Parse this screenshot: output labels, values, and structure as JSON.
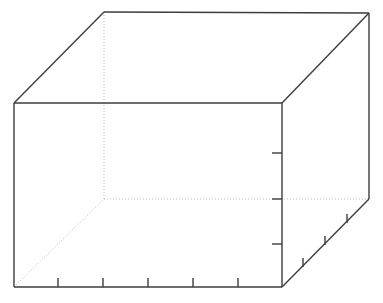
{
  "figure": {
    "title": "",
    "background_color": "#ffffff",
    "width": 383,
    "height": 303
  },
  "chart_data": {
    "type": "line",
    "title": "",
    "xlabel": "",
    "ylabel": "",
    "zlabel": "",
    "series": [],
    "categories": [],
    "values": [],
    "grid": false,
    "legend": "none",
    "projection": "3d",
    "note": "No data series plotted; only the empty 3D axes pane outline with tick marks is visible.",
    "axes_3d": {
      "solid_edge_color": "#3d3d3d",
      "hidden_edge_color": "#b6b6b6",
      "solid_edge_width": 1.4,
      "hidden_edge_width": 1.0,
      "hidden_edge_dash": "1,2",
      "tick_color": "#3d3d3d",
      "tick_width": 1.4,
      "vertices": {
        "front_bottom_left": {
          "x": 14,
          "y": 287
        },
        "front_top_left": {
          "x": 14,
          "y": 103
        },
        "front_bottom_right": {
          "x": 282,
          "y": 287
        },
        "front_top_right": {
          "x": 282,
          "y": 103
        },
        "back_top_left": {
          "x": 104,
          "y": 12
        },
        "back_top_right": {
          "x": 369,
          "y": 13
        },
        "back_bottom_right": {
          "x": 369,
          "y": 199
        },
        "back_bottom_left": {
          "x": 104,
          "y": 199
        }
      },
      "solid_edges": [
        {
          "name": "front-bottom-edge",
          "x1": 14,
          "y1": 287,
          "x2": 282,
          "y2": 287
        },
        {
          "name": "front-left-vertical-edge",
          "x1": 14,
          "y1": 287,
          "x2": 14,
          "y2": 103
        },
        {
          "name": "front-top-edge",
          "x1": 14,
          "y1": 103,
          "x2": 282,
          "y2": 103
        },
        {
          "name": "front-right-vertical-edge",
          "x1": 282,
          "y1": 103,
          "x2": 282,
          "y2": 287
        },
        {
          "name": "top-left-depth-edge",
          "x1": 14,
          "y1": 103,
          "x2": 104,
          "y2": 12
        },
        {
          "name": "top-back-edge",
          "x1": 104,
          "y1": 12,
          "x2": 369,
          "y2": 13
        },
        {
          "name": "top-right-depth-edge",
          "x1": 282,
          "y1": 103,
          "x2": 369,
          "y2": 13
        },
        {
          "name": "back-right-vertical-edge",
          "x1": 369,
          "y1": 13,
          "x2": 369,
          "y2": 199
        },
        {
          "name": "bottom-right-depth-edge",
          "x1": 282,
          "y1": 287,
          "x2": 369,
          "y2": 199
        }
      ],
      "hidden_edges": [
        {
          "name": "back-left-vertical-edge",
          "x1": 104,
          "y1": 12,
          "x2": 104,
          "y2": 199
        },
        {
          "name": "back-bottom-edge",
          "x1": 104,
          "y1": 199,
          "x2": 369,
          "y2": 199
        },
        {
          "name": "bottom-left-depth-edge",
          "x1": 14,
          "y1": 287,
          "x2": 104,
          "y2": 199
        }
      ],
      "x_axis_ticks": {
        "count": 5,
        "labels": [
          "",
          "",
          "",
          "",
          ""
        ],
        "marks": [
          {
            "x1": 58,
            "y1": 287,
            "x2": 58,
            "y2": 278
          },
          {
            "x1": 103,
            "y1": 287,
            "x2": 103,
            "y2": 278
          },
          {
            "x1": 148,
            "y1": 287,
            "x2": 148,
            "y2": 278
          },
          {
            "x1": 193,
            "y1": 287,
            "x2": 193,
            "y2": 278
          },
          {
            "x1": 238,
            "y1": 287,
            "x2": 238,
            "y2": 278
          }
        ]
      },
      "z_axis_ticks": {
        "count": 3,
        "labels": [
          "",
          "",
          ""
        ],
        "marks": [
          {
            "x1": 282,
            "y1": 153,
            "x2": 272,
            "y2": 153
          },
          {
            "x1": 282,
            "y1": 199,
            "x2": 272,
            "y2": 199
          },
          {
            "x1": 282,
            "y1": 244,
            "x2": 272,
            "y2": 244
          }
        ]
      },
      "y_axis_ticks": {
        "count": 3,
        "labels": [
          "",
          "",
          ""
        ],
        "marks": [
          {
            "x1": 303,
            "y1": 267,
            "x2": 303,
            "y2": 258
          },
          {
            "x1": 325,
            "y1": 245,
            "x2": 325,
            "y2": 236
          },
          {
            "x1": 347,
            "y1": 223,
            "x2": 347,
            "y2": 214
          }
        ]
      }
    }
  }
}
